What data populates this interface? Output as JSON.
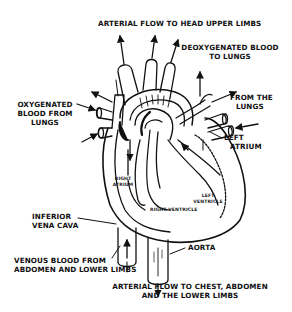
{
  "diagram": {
    "labels": {
      "arterial_head": "ARTERIAL FLOW TO HEAD UPPER LIMBS",
      "deoxy_line1": "DEOXYGENATED BLOOD",
      "deoxy_line2": "TO LUNGS",
      "from_lungs_line1": "FROM THE",
      "from_lungs_line2": "LUNGS",
      "oxy_line1": "OXYGENATED",
      "oxy_line2": "BLOOD FROM",
      "oxy_line3": "LUNGS",
      "left_atrium_line1": "LEFT",
      "left_atrium_line2": "ATRIUM",
      "right_atrium_line1": "RIGHT",
      "right_atrium_line2": "ATRIUM",
      "left_ventricle_line1": "LEFT",
      "left_ventricle_line2": "VENTRICLE",
      "right_ventricle": "RIGHT VENTRICLE",
      "ivc_line1": "INFERIOR",
      "ivc_line2": "VENA CAVA",
      "venous_line1": "VENOUS BLOOD FROM",
      "venous_line2": "ABDOMEN AND LOWER LIMBS",
      "aorta": "AORTA",
      "arterial_chest_line1": "ARTERIAL FLOW TO CHEST, ABDOMEN",
      "arterial_chest_line2": "AND THE LOWER LIMBS"
    },
    "colors": {
      "ink": "#111111",
      "background": "#ffffff"
    }
  }
}
